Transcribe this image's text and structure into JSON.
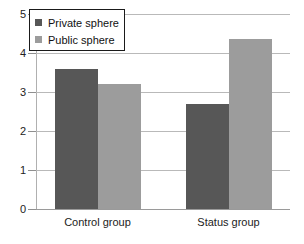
{
  "chart_data": {
    "type": "bar",
    "title": "",
    "subtitle": "",
    "xlabel": "",
    "ylabel": "",
    "categories": [
      "Control group",
      "Status group"
    ],
    "series": [
      {
        "name": "Private sphere",
        "values": [
          3.6,
          2.7
        ],
        "color": "#575757"
      },
      {
        "name": "Public sphere",
        "values": [
          3.2,
          4.35
        ],
        "color": "#9c9c9c"
      }
    ],
    "ylim": [
      0,
      5
    ],
    "yticks": [
      0,
      1,
      2,
      3,
      4,
      5
    ],
    "ytick_labels": [
      "0",
      "1",
      "2",
      "3",
      "4",
      "5"
    ],
    "grid": true,
    "grid_axis": "y",
    "legend_position": "upper-left-inside",
    "legend_entries": [
      "Private sphere",
      "Public sphere"
    ],
    "annotations": []
  },
  "legend": {
    "items": [
      {
        "label": "Private sphere",
        "swatch": "private-swatch-icon"
      },
      {
        "label": "Public sphere",
        "swatch": "public-swatch-icon"
      }
    ]
  },
  "axes": {
    "y_tick_labels": [
      "5",
      "4",
      "3",
      "2",
      "1",
      "0"
    ],
    "x_categories": [
      "Control group",
      "Status group"
    ]
  },
  "colors": {
    "private": "#575757",
    "public": "#9c9c9c",
    "grid": "#b9b9b9",
    "axis": "#9a9a9a",
    "text": "#222222",
    "background": "#ffffff"
  }
}
